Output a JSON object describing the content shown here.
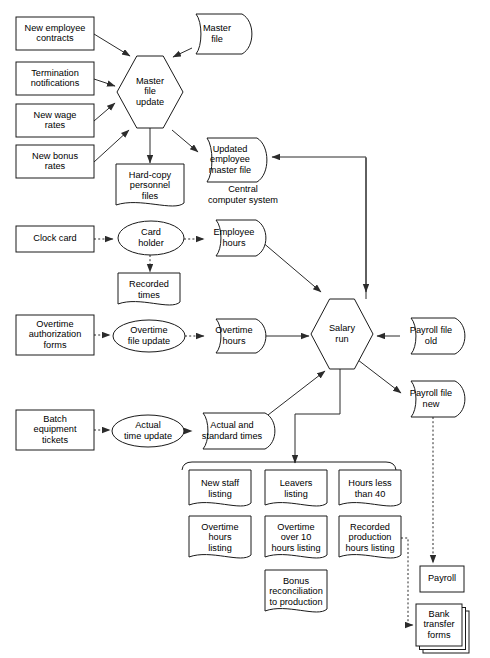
{
  "diagram": {
    "free_labels": [
      {
        "id": "central-computer-system",
        "line1": "Central",
        "line2": "computer system",
        "x": 243,
        "y": 192
      }
    ],
    "nodes": [
      {
        "id": "new-employee-contracts",
        "shape": "rect",
        "lines": [
          "New employee",
          "contracts"
        ],
        "x": 16,
        "y": 17,
        "w": 78,
        "h": 33
      },
      {
        "id": "termination-notifications",
        "shape": "rect",
        "lines": [
          "Termination",
          "notifications"
        ],
        "x": 16,
        "y": 62,
        "w": 78,
        "h": 33
      },
      {
        "id": "new-wage-rates",
        "shape": "rect",
        "lines": [
          "New wage",
          "rates"
        ],
        "x": 16,
        "y": 104,
        "w": 78,
        "h": 33
      },
      {
        "id": "new-bonus-rates",
        "shape": "rect",
        "lines": [
          "New bonus",
          "rates"
        ],
        "x": 16,
        "y": 145,
        "w": 78,
        "h": 33
      },
      {
        "id": "master-file-update",
        "shape": "hexagon",
        "lines": [
          "Master",
          "file",
          "update"
        ],
        "x": 117,
        "y": 56,
        "w": 66,
        "h": 72
      },
      {
        "id": "master-file",
        "shape": "tape",
        "lines": [
          "Master",
          "file"
        ],
        "x": 185,
        "y": 14,
        "w": 68,
        "h": 40
      },
      {
        "id": "updated-employee-master-file",
        "shape": "tape",
        "lines": [
          "Updated",
          "employee",
          "master file"
        ],
        "x": 196,
        "y": 138,
        "w": 72,
        "h": 44
      },
      {
        "id": "hard-copy-personnel-files",
        "shape": "document",
        "lines": [
          "Hard-copy",
          "personnel",
          "files"
        ],
        "x": 116,
        "y": 164,
        "w": 68,
        "h": 44
      },
      {
        "id": "clock-card",
        "shape": "rect",
        "lines": [
          "Clock card"
        ],
        "x": 16,
        "y": 226,
        "w": 78,
        "h": 26
      },
      {
        "id": "card-holder",
        "shape": "ellipse",
        "lines": [
          "Card",
          "holder"
        ],
        "x": 118,
        "y": 221,
        "w": 66,
        "h": 34
      },
      {
        "id": "employee-hours",
        "shape": "tape",
        "lines": [
          "Employee",
          "hours"
        ],
        "x": 205,
        "y": 220,
        "w": 62,
        "h": 36
      },
      {
        "id": "recorded-times",
        "shape": "document",
        "lines": [
          "Recorded",
          "times"
        ],
        "x": 118,
        "y": 273,
        "w": 62,
        "h": 34
      },
      {
        "id": "overtime-authorization-forms",
        "shape": "rect",
        "lines": [
          "Overtime",
          "authorization",
          "forms"
        ],
        "x": 16,
        "y": 315,
        "w": 78,
        "h": 40
      },
      {
        "id": "overtime-file-update",
        "shape": "ellipse",
        "lines": [
          "Overtime",
          "file update"
        ],
        "x": 113,
        "y": 320,
        "w": 72,
        "h": 32
      },
      {
        "id": "overtime-hours",
        "shape": "tape",
        "lines": [
          "Overtime",
          "hours"
        ],
        "x": 205,
        "y": 319,
        "w": 62,
        "h": 34
      },
      {
        "id": "salary-run",
        "shape": "hexagon",
        "lines": [
          "Salary",
          "run"
        ],
        "x": 311,
        "y": 299,
        "w": 62,
        "h": 70
      },
      {
        "id": "payroll-file-old",
        "shape": "tape",
        "lines": [
          "Payroll file",
          "old"
        ],
        "x": 400,
        "y": 318,
        "w": 66,
        "h": 36
      },
      {
        "id": "payroll-file-new",
        "shape": "tape",
        "lines": [
          "Payroll file",
          "new"
        ],
        "x": 400,
        "y": 381,
        "w": 66,
        "h": 36
      },
      {
        "id": "batch-equipment-tickets",
        "shape": "rect",
        "lines": [
          "Batch",
          "equipment",
          "tickets",
          ""
        ],
        "x": 16,
        "y": 410,
        "w": 78,
        "h": 40
      },
      {
        "id": "actual-time-update",
        "shape": "ellipse",
        "lines": [
          "Actual",
          "time update"
        ],
        "x": 112,
        "y": 415,
        "w": 72,
        "h": 32
      },
      {
        "id": "actual-and-standard-times",
        "shape": "tape",
        "lines": [
          "Actual and",
          "standard times"
        ],
        "x": 192,
        "y": 413,
        "w": 84,
        "h": 36
      },
      {
        "id": "new-staff-listing",
        "shape": "document",
        "lines": [
          "New staff",
          "listing"
        ],
        "x": 189,
        "y": 470,
        "w": 62,
        "h": 38
      },
      {
        "id": "leavers-listing",
        "shape": "document",
        "lines": [
          "Leavers",
          "listing"
        ],
        "x": 265,
        "y": 470,
        "w": 62,
        "h": 38
      },
      {
        "id": "hours-less-than-40",
        "shape": "document",
        "lines": [
          "Hours less",
          "than 40"
        ],
        "x": 339,
        "y": 470,
        "w": 62,
        "h": 38
      },
      {
        "id": "overtime-hours-listing",
        "shape": "document",
        "lines": [
          "Overtime",
          "hours",
          "listing"
        ],
        "x": 189,
        "y": 516,
        "w": 62,
        "h": 44
      },
      {
        "id": "overtime-over-10-hours-listing",
        "shape": "document",
        "lines": [
          "Overtime",
          "over 10",
          "hours listing"
        ],
        "x": 265,
        "y": 516,
        "w": 62,
        "h": 44
      },
      {
        "id": "recorded-production-hours-listing",
        "shape": "document",
        "lines": [
          "Recorded",
          "production",
          "hours listing"
        ],
        "x": 339,
        "y": 516,
        "w": 62,
        "h": 44
      },
      {
        "id": "bonus-reconciliation-to-production",
        "shape": "document",
        "lines": [
          "Bonus",
          "reconciliation",
          "to production"
        ],
        "x": 265,
        "y": 570,
        "w": 62,
        "h": 44
      },
      {
        "id": "payroll",
        "shape": "rect",
        "lines": [
          "Payroll"
        ],
        "x": 420,
        "y": 566,
        "w": 44,
        "h": 26
      },
      {
        "id": "bank-transfer-forms",
        "shape": "stacked-rect",
        "lines": [
          "Bank",
          "transfer",
          "forms"
        ],
        "x": 416,
        "y": 604,
        "w": 46,
        "h": 42
      }
    ],
    "edges": [
      {
        "id": "new-employee-contracts-to-master-file-update",
        "style": "solid",
        "arrow": true
      },
      {
        "id": "termination-notifications-to-master-file-update",
        "style": "solid",
        "arrow": true
      },
      {
        "id": "new-wage-rates-to-master-file-update",
        "style": "solid",
        "arrow": true
      },
      {
        "id": "new-bonus-rates-to-master-file-update",
        "style": "solid",
        "arrow": true
      },
      {
        "id": "master-file-to-master-file-update",
        "style": "solid",
        "arrow": true
      },
      {
        "id": "master-file-update-to-hard-copy-personnel-files",
        "style": "solid",
        "arrow": true
      },
      {
        "id": "master-file-update-to-updated-employee-master-file",
        "style": "solid",
        "arrow": true
      },
      {
        "id": "salary-run-to-updated-employee-master-file",
        "style": "solid",
        "arrow": true
      },
      {
        "id": "clock-card-to-card-holder",
        "style": "dotted",
        "arrow": true
      },
      {
        "id": "card-holder-to-employee-hours",
        "style": "dotted",
        "arrow": true
      },
      {
        "id": "card-holder-to-recorded-times",
        "style": "dotted",
        "arrow": true
      },
      {
        "id": "employee-hours-to-salary-run",
        "style": "solid",
        "arrow": true
      },
      {
        "id": "overtime-authorization-forms-to-overtime-file-update",
        "style": "dotted",
        "arrow": true
      },
      {
        "id": "overtime-file-update-to-overtime-hours",
        "style": "dotted",
        "arrow": true
      },
      {
        "id": "overtime-hours-to-salary-run",
        "style": "solid",
        "arrow": true
      },
      {
        "id": "payroll-file-old-to-salary-run",
        "style": "solid",
        "arrow": true
      },
      {
        "id": "salary-run-to-payroll-file-new",
        "style": "solid",
        "arrow": true
      },
      {
        "id": "batch-equipment-tickets-to-actual-time-update",
        "style": "dotted",
        "arrow": true
      },
      {
        "id": "actual-time-update-to-actual-and-standard-times",
        "style": "dotted",
        "arrow": true
      },
      {
        "id": "actual-and-standard-times-to-salary-run",
        "style": "solid",
        "arrow": true
      },
      {
        "id": "salary-run-to-listings",
        "style": "solid",
        "arrow": true
      },
      {
        "id": "payroll-file-new-to-payroll",
        "style": "dotted",
        "arrow": true
      },
      {
        "id": "recorded-production-hours-listing-to-bank-transfer-forms",
        "style": "dotted",
        "arrow": true
      }
    ]
  }
}
